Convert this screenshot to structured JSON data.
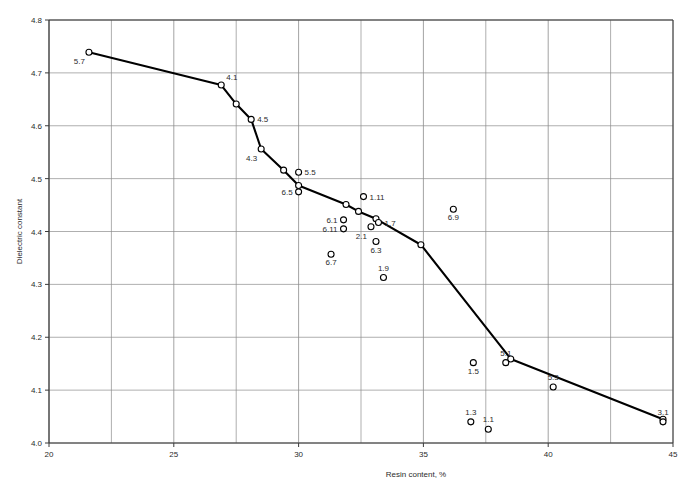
{
  "chart_data": {
    "type": "scatter",
    "title": "",
    "xlabel": "Resin content, %",
    "ylabel": "Dielectric constant",
    "xlim": [
      20,
      45
    ],
    "ylim": [
      4.0,
      4.8
    ],
    "x_major_ticks": [
      20,
      25,
      30,
      35,
      40,
      45
    ],
    "x_major_tick_labels": [
      "20",
      "25",
      "30",
      "35",
      "40",
      "45"
    ],
    "x_minor_gridlines": [
      22.5,
      27.5,
      32.5,
      37.5,
      42.5
    ],
    "y_major_ticks": [
      4.0,
      4.1,
      4.2,
      4.3,
      4.4,
      4.5,
      4.6,
      4.7,
      4.8
    ],
    "y_major_tick_labels": [
      "4.0",
      "4.1",
      "4.2",
      "4.3",
      "4.4",
      "4.5",
      "4.6",
      "4.7",
      "4.8"
    ],
    "grid": true,
    "legend": "none",
    "line_color": "#000000",
    "grid_color": "#8c8c8c",
    "axis_color": "#3a3a3a",
    "marker_color": "#000000",
    "series": [
      {
        "name": "Dielectric constant vs resin content",
        "connected": true,
        "points": [
          {
            "x": 21.6,
            "y": 4.739,
            "label": "5.7",
            "label_pos": "below-left"
          },
          {
            "x": 26.9,
            "y": 4.677,
            "label": "4.1",
            "label_pos": "above-right"
          },
          {
            "x": 27.5,
            "y": 4.641,
            "label": "",
            "label_pos": "none"
          },
          {
            "x": 28.1,
            "y": 4.612,
            "label": "4.5",
            "label_pos": "right"
          },
          {
            "x": 28.5,
            "y": 4.556,
            "label": "4.3",
            "label_pos": "below-left"
          },
          {
            "x": 29.4,
            "y": 4.516,
            "label": "",
            "label_pos": "none"
          },
          {
            "x": 30.0,
            "y": 4.487,
            "label": "",
            "label_pos": "none"
          },
          {
            "x": 31.9,
            "y": 4.451,
            "label": "",
            "label_pos": "none"
          },
          {
            "x": 32.4,
            "y": 4.438,
            "label": "",
            "label_pos": "none"
          },
          {
            "x": 33.1,
            "y": 4.424,
            "label": "",
            "label_pos": "none"
          },
          {
            "x": 34.9,
            "y": 4.375,
            "label": "",
            "label_pos": "none"
          },
          {
            "x": 38.5,
            "y": 4.159,
            "label": "",
            "label_pos": "none"
          },
          {
            "x": 44.6,
            "y": 4.045,
            "label": "",
            "label_pos": "none"
          }
        ]
      },
      {
        "name": "Scattered labelled specimens",
        "connected": false,
        "points": [
          {
            "x": 30.0,
            "y": 4.512,
            "label": "5.5",
            "label_pos": "right"
          },
          {
            "x": 30.0,
            "y": 4.475,
            "label": "6.5",
            "label_pos": "left"
          },
          {
            "x": 32.6,
            "y": 4.466,
            "label": "1.11",
            "label_pos": "right"
          },
          {
            "x": 31.8,
            "y": 4.422,
            "label": "6.1",
            "label_pos": "left"
          },
          {
            "x": 31.8,
            "y": 4.405,
            "label": "6.11",
            "label_pos": "left"
          },
          {
            "x": 33.2,
            "y": 4.417,
            "label": "1.7",
            "label_pos": "right"
          },
          {
            "x": 32.9,
            "y": 4.409,
            "label": "2.1",
            "label_pos": "below-left"
          },
          {
            "x": 33.1,
            "y": 4.381,
            "label": "6.3",
            "label_pos": "below"
          },
          {
            "x": 31.3,
            "y": 4.357,
            "label": "6.7",
            "label_pos": "below"
          },
          {
            "x": 33.4,
            "y": 4.313,
            "label": "1.9",
            "label_pos": "above"
          },
          {
            "x": 36.2,
            "y": 4.442,
            "label": "6.9",
            "label_pos": "below"
          },
          {
            "x": 37.0,
            "y": 4.152,
            "label": "1.5",
            "label_pos": "below"
          },
          {
            "x": 38.3,
            "y": 4.152,
            "label": "5.1",
            "label_pos": "above"
          },
          {
            "x": 40.2,
            "y": 4.106,
            "label": "5.3",
            "label_pos": "above"
          },
          {
            "x": 36.9,
            "y": 4.04,
            "label": "1.3",
            "label_pos": "above"
          },
          {
            "x": 37.6,
            "y": 4.026,
            "label": "1.1",
            "label_pos": "above"
          },
          {
            "x": 44.6,
            "y": 4.04,
            "label": "3.1",
            "label_pos": "above"
          }
        ]
      }
    ]
  }
}
